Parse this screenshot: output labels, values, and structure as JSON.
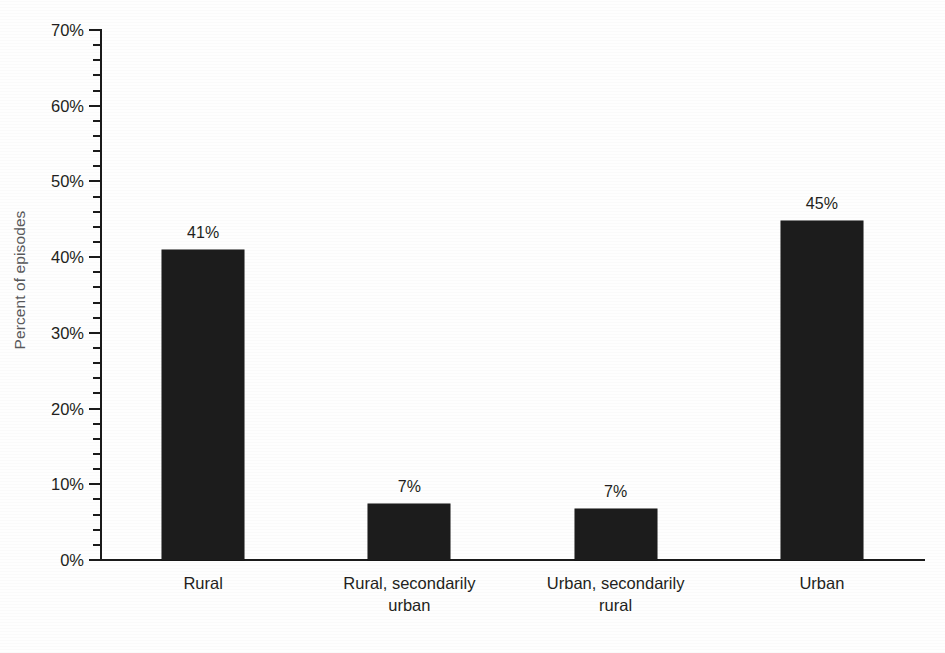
{
  "chart_data": {
    "type": "bar",
    "title": "",
    "subtitle": "",
    "xlabel": "",
    "ylabel": "Percent of episodes",
    "categories": [
      "Rural",
      "Rural, secondarily\nurban",
      "Urban, secondarily\nrural",
      "Urban"
    ],
    "values": [
      41,
      7.4,
      6.8,
      44.8
    ],
    "data_labels": [
      "41%",
      "7%",
      "7%",
      "45%"
    ],
    "ylim": [
      0,
      70
    ],
    "ytick_values": [
      0,
      10,
      20,
      30,
      40,
      50,
      60,
      70
    ],
    "ytick_labels": [
      "0%",
      "10%",
      "20%",
      "30%",
      "40%",
      "50%",
      "60%",
      "70%"
    ],
    "yminor_tick_step": 2,
    "grid": false,
    "legend": false,
    "legend_position": "none",
    "bar_color": "#1c1c1c",
    "axis_color": "#1a1a1a",
    "label_color": "#231f20",
    "ylabel_color": "#58595b",
    "background": "#ffffff"
  }
}
